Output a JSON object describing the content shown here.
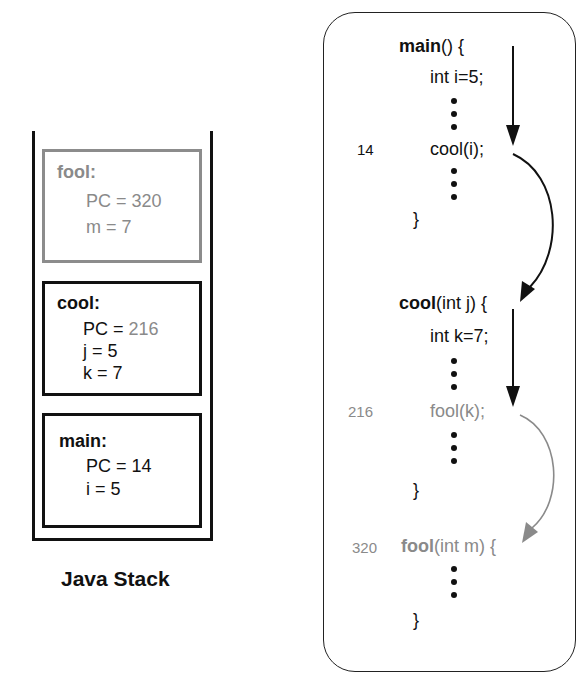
{
  "stack": {
    "label": "Java Stack",
    "frames": [
      {
        "name": "fool:",
        "lines": [
          {
            "key": "PC = ",
            "value": "320"
          },
          {
            "key": "m = 7",
            "value": ""
          }
        ],
        "state": "inactive-gray"
      },
      {
        "name": "cool:",
        "lines": [
          {
            "key": "PC = ",
            "value": "216"
          },
          {
            "key": "j = 5",
            "value": ""
          },
          {
            "key": "k = 7",
            "value": ""
          }
        ],
        "state": "active"
      },
      {
        "name": "main:",
        "lines": [
          {
            "key": "PC = 14",
            "value": ""
          },
          {
            "key": "i = 5",
            "value": ""
          }
        ],
        "state": "active"
      }
    ]
  },
  "code": {
    "main": {
      "name": "main",
      "signature_rest": "() {",
      "lines": [
        "int i=5;",
        "cool(i);",
        "}"
      ],
      "call_line_number": "14"
    },
    "cool": {
      "name": "cool",
      "signature_rest": "(int j) {",
      "lines": [
        "int k=7;",
        "fool(k);",
        "}"
      ],
      "call_line_number": "216"
    },
    "fool": {
      "name": "fool",
      "signature_rest": "(int m) {",
      "lines": [
        "}"
      ],
      "line_number": "320"
    }
  },
  "colors": {
    "active": "#111111",
    "inactive": "#8a8a8a"
  }
}
